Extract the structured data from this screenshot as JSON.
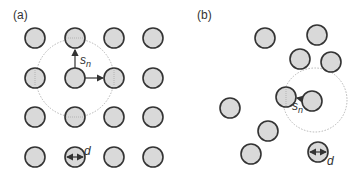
{
  "panels": [
    {
      "label": "(a)",
      "arrangement": "square-lattice",
      "spacing_label": "s",
      "spacing_sub": "n",
      "diameter_label": "d"
    },
    {
      "label": "(b)",
      "arrangement": "random",
      "spacing_label": "s",
      "spacing_sub": "n",
      "diameter_label": "d"
    }
  ],
  "colors": {
    "particle_fill": "#d9d9d9",
    "particle_stroke": "#333333",
    "arrow": "#333333",
    "neighborhood_circle": "#b0b0b0"
  }
}
